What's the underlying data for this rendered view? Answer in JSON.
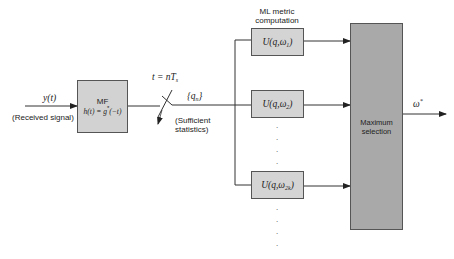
{
  "input": {
    "signal_label": "y(t)",
    "signal_caption": "(Received signal)"
  },
  "matched_filter": {
    "title": "MF",
    "equation_lhs": "h(t) = g",
    "equation_sup": "*",
    "equation_rhs": "(−t)"
  },
  "sampler": {
    "label_prefix": "t = nT",
    "label_sub": "s"
  },
  "statistics": {
    "symbol_main": "{q",
    "symbol_sub": "n",
    "symbol_close": "}",
    "caption_line1": "(Sufficient",
    "caption_line2": "statistics)"
  },
  "metric_header": {
    "line1": "ML metric",
    "line2": "computation"
  },
  "metric_blocks": [
    {
      "prefix": "U(q,ω",
      "sub": "1",
      "suffix": ")"
    },
    {
      "prefix": "U(q,ω",
      "sub": "2",
      "suffix": ")"
    },
    {
      "prefix": "U(q,ω",
      "sub": "2k",
      "suffix": ")"
    }
  ],
  "ellipsis": {
    "middle": "·",
    "bottom": "·"
  },
  "selector": {
    "line1": "Maximum",
    "line2": "selection"
  },
  "output": {
    "symbol": "ω",
    "sup": "*"
  },
  "colors": {
    "line": "#333333",
    "mf_fill": "#d2d2d2",
    "metric_fill": "#d4d4d4",
    "selector_fill": "#a9a9a9"
  }
}
